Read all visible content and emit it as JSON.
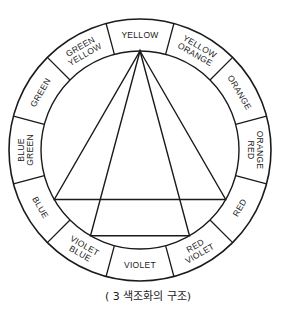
{
  "wheel": {
    "center": [
      140,
      150
    ],
    "outer_radius": 131,
    "inner_radius": 99,
    "segments": [
      {
        "angle": 0,
        "lines": [
          "YELLOW"
        ]
      },
      {
        "angle": 30,
        "lines": [
          "YELLOW",
          "ORANGE"
        ]
      },
      {
        "angle": 60,
        "lines": [
          "ORANGE"
        ]
      },
      {
        "angle": 90,
        "lines": [
          "ORANGE",
          "RED"
        ]
      },
      {
        "angle": 120,
        "lines": [
          "RED"
        ]
      },
      {
        "angle": 150,
        "lines": [
          "RED",
          "VIOLET"
        ]
      },
      {
        "angle": 180,
        "lines": [
          "VIOLET"
        ]
      },
      {
        "angle": 210,
        "lines": [
          "VIOLET",
          "BLUE"
        ]
      },
      {
        "angle": 240,
        "lines": [
          "BLUE"
        ]
      },
      {
        "angle": 270,
        "lines": [
          "BLUE",
          "GREEN"
        ]
      },
      {
        "angle": 300,
        "lines": [
          "GREEN"
        ]
      },
      {
        "angle": 330,
        "lines": [
          "GREEN",
          "YELLOW"
        ]
      }
    ],
    "triads": [
      {
        "name": "primary-triad",
        "vertex_angles": [
          0,
          120,
          240
        ]
      },
      {
        "name": "split-triad",
        "vertex_angles": [
          0,
          150,
          210
        ]
      }
    ],
    "line_color": "#1a1a1a"
  },
  "caption": "( 3 색조화의  구조)"
}
